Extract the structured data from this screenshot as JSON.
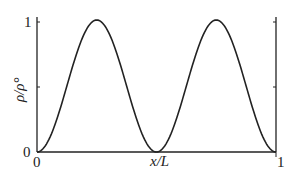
{
  "chart_data": {
    "type": "line",
    "title": "",
    "xlabel": "x/L",
    "ylabel": "ρ/ρ°",
    "xlim": [
      0,
      1
    ],
    "ylim": [
      0,
      1
    ],
    "x_ticks": [
      "0",
      "1"
    ],
    "y_ticks": [
      "0",
      "1"
    ],
    "grid": false,
    "legend": null,
    "series": [
      {
        "name": "density",
        "x": [
          0,
          0.05,
          0.1,
          0.15,
          0.2,
          0.25,
          0.3,
          0.35,
          0.4,
          0.45,
          0.5,
          0.55,
          0.6,
          0.65,
          0.7,
          0.75,
          0.8,
          0.85,
          0.9,
          0.95,
          1
        ],
        "values": [
          0,
          0.095,
          0.345,
          0.655,
          0.905,
          1,
          0.905,
          0.655,
          0.345,
          0.095,
          0,
          0.095,
          0.345,
          0.655,
          0.905,
          1,
          0.905,
          0.655,
          0.345,
          0.095,
          0
        ]
      }
    ]
  },
  "labels": {
    "y_top": "1",
    "y_bottom": "0",
    "x_left": "0",
    "x_right": "1",
    "x_axis": "x/L",
    "y_axis": "ρ/ρ°"
  }
}
